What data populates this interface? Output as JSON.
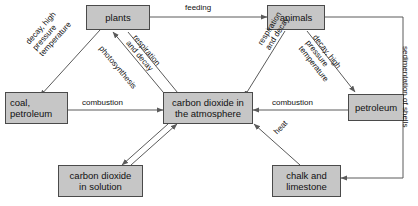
{
  "diagram": {
    "box_fill": "#c6c6c6",
    "box_border": "#4a4a4a",
    "line_color": "#5a5a5a",
    "background": "#ffffff"
  },
  "nodes": [
    {
      "id": "plants",
      "label": "plants"
    },
    {
      "id": "animals",
      "label": "animals"
    },
    {
      "id": "coal",
      "label": "coal,\npetroleum"
    },
    {
      "id": "atmosphere",
      "label": "carbon dioxide in\nthe atmosphere"
    },
    {
      "id": "petroleum",
      "label": "petroleum"
    },
    {
      "id": "solution",
      "label": "carbon dioxide\nin solution"
    },
    {
      "id": "chalk",
      "label": "chalk and\nlimestone"
    }
  ],
  "edges": [
    {
      "id": "plants-animals",
      "label": "feeding"
    },
    {
      "id": "plants-coal",
      "label": "decay, high\npressure\ntemperature"
    },
    {
      "id": "atmosphere-plants",
      "label": "photosynthesis"
    },
    {
      "id": "plants-atmosphere",
      "label": "respiration\nand decay"
    },
    {
      "id": "animals-atmosphere",
      "label": "respiration\nand decay"
    },
    {
      "id": "animals-petroleum",
      "label": "decay, high\npressure\ntemperature"
    },
    {
      "id": "coal-atmosphere",
      "label": "combustion"
    },
    {
      "id": "petroleum-atmosphere",
      "label": "combustion"
    },
    {
      "id": "chalk-atmosphere",
      "label": "heat"
    },
    {
      "id": "animals-chalk",
      "label": "sedimentation of shells"
    }
  ]
}
